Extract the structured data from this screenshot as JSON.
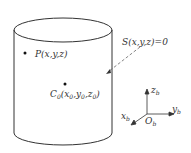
{
  "labels": {
    "surface": "S(x,y,z)=0",
    "point": "P(x,y,z)",
    "center_main": "C",
    "center_sub": "0",
    "center_args": "(x",
    "x0": "0",
    "y": ",y",
    "y0": "0",
    "z": ",z",
    "z0": "0",
    "close": ")",
    "axis_z": "z",
    "axis_y": "y",
    "axis_x": "x",
    "origin": "O",
    "frame_sub": "b"
  },
  "colors": {
    "stroke": "#333333",
    "dashed": "#666666"
  }
}
